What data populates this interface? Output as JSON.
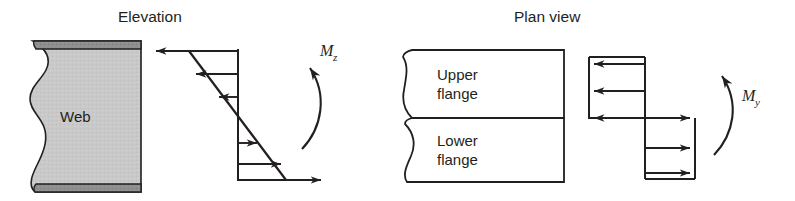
{
  "figure": {
    "width": 795,
    "height": 201,
    "background": "#ffffff",
    "ink_color": "#231f20"
  },
  "panels": {
    "elevation": {
      "title": "Elevation",
      "section": {
        "web_label": "Web",
        "web_fill": "#c9c9c9",
        "flange_fill": "#8a8a8a",
        "outline": "#231f20"
      },
      "stress_diagram": {
        "type": "linear-bending-stress",
        "shape": "bi-triangular",
        "arrows": [
          {
            "row": 1,
            "direction": "left",
            "length": 83,
            "y": 51
          },
          {
            "row": 2,
            "direction": "left",
            "length": 43,
            "y": 74
          },
          {
            "row": 3,
            "direction": "left",
            "length": 20,
            "y": 97
          },
          {
            "row": 4,
            "direction": "right",
            "length": 20,
            "y": 143
          },
          {
            "row": 5,
            "direction": "right",
            "length": 43,
            "y": 164
          },
          {
            "row": 6,
            "direction": "right",
            "length": 83,
            "y": 180
          }
        ]
      },
      "moment": {
        "symbol": "M",
        "subscript": "z",
        "sense": "counter-clockwise-up"
      }
    },
    "plan": {
      "title": "Plan view",
      "section": {
        "upper_flange_label_line1": "Upper",
        "upper_flange_label_line2": "flange",
        "lower_flange_label_line1": "Lower",
        "lower_flange_label_line2": "flange",
        "fill": "#ffffff",
        "outline": "#231f20"
      },
      "stress_diagram": {
        "type": "step-flange-stress",
        "shape": "offset-rectangles",
        "arrows": [
          {
            "row": 1,
            "direction": "left",
            "flange": "upper",
            "y": 64
          },
          {
            "row": 2,
            "direction": "left",
            "flange": "upper",
            "y": 91
          },
          {
            "row": 3,
            "direction": "left",
            "flange": "upper",
            "y": 118
          },
          {
            "row": 4,
            "direction": "right",
            "flange": "lower",
            "y": 118
          },
          {
            "row": 5,
            "direction": "right",
            "flange": "lower",
            "y": 148
          },
          {
            "row": 6,
            "direction": "right",
            "flange": "lower",
            "y": 173
          }
        ]
      },
      "moment": {
        "symbol": "M",
        "subscript": "y",
        "sense": "counter-clockwise-up"
      }
    }
  }
}
